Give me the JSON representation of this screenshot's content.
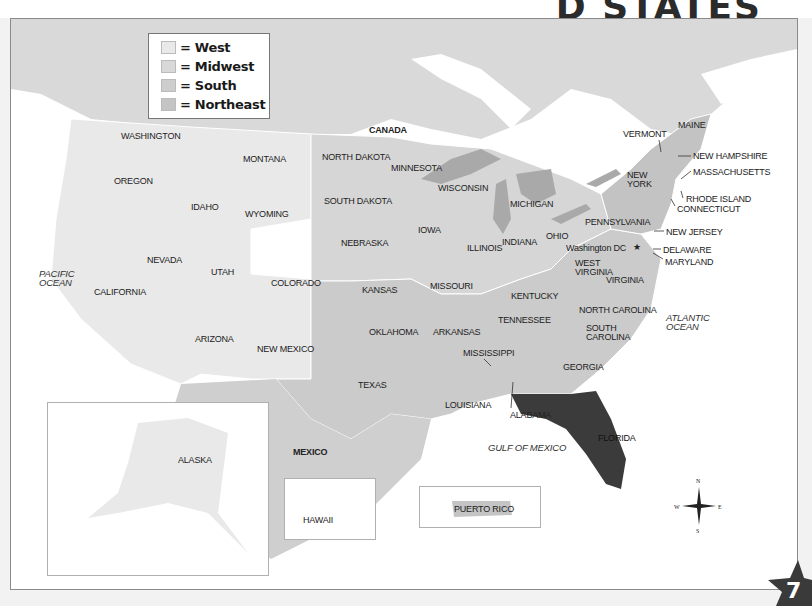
{
  "title": {
    "visible_fragment": "D STATES"
  },
  "legend": {
    "items": [
      {
        "label": "= West",
        "color": "#e9e9e9"
      },
      {
        "label": "= Midwest",
        "color": "#d8d8d8"
      },
      {
        "label": "= South",
        "color": "#cdcdcd"
      },
      {
        "label": "= Northeast",
        "color": "#c4c4c4"
      }
    ]
  },
  "countries": {
    "canada": "CANADA",
    "mexico": "MEXICO"
  },
  "oceans": {
    "pacific_1": "PACIFIC",
    "pacific_2": "OCEAN",
    "atlantic_1": "ATLANTIC",
    "atlantic_2": "OCEAN",
    "gulf": "GULF OF MEXICO"
  },
  "states": {
    "washington": "WASHINGTON",
    "oregon": "OREGON",
    "california": "CALIFORNIA",
    "idaho": "IDAHO",
    "nevada": "NEVADA",
    "montana": "MONTANA",
    "wyoming": "WYOMING",
    "utah": "UTAH",
    "colorado": "COLORADO",
    "arizona": "ARIZONA",
    "new_mexico": "NEW MEXICO",
    "north_dakota": "NORTH DAKOTA",
    "south_dakota": "SOUTH DAKOTA",
    "nebraska": "NEBRASKA",
    "kansas": "KANSAS",
    "minnesota": "MINNESOTA",
    "iowa": "IOWA",
    "missouri": "MISSOURI",
    "wisconsin": "WISCONSIN",
    "illinois": "ILLINOIS",
    "michigan": "MICHIGAN",
    "indiana": "INDIANA",
    "ohio": "OHIO",
    "oklahoma": "OKLAHOMA",
    "texas": "TEXAS",
    "arkansas": "ARKANSAS",
    "louisiana": "LOUISIANA",
    "mississippi": "MISSISSIPPI",
    "alabama": "ALABAMA",
    "tennessee": "TENNESSEE",
    "kentucky": "KENTUCKY",
    "georgia": "GEORGIA",
    "florida": "FLORIDA",
    "south_carolina_1": "SOUTH",
    "south_carolina_2": "CAROLINA",
    "north_carolina": "NORTH CAROLINA",
    "virginia": "VIRGINIA",
    "west_virginia_1": "WEST",
    "west_virginia_2": "VIRGINIA",
    "pennsylvania": "PENNSYLVANIA",
    "new_york_1": "NEW",
    "new_york_2": "YORK",
    "vermont": "VERMONT",
    "maine": "MAINE",
    "new_hampshire": "NEW HAMPSHIRE",
    "massachusetts": "MASSACHUSETTS",
    "rhode_island": "RHODE ISLAND",
    "connecticut": "CONNECTICUT",
    "new_jersey": "NEW JERSEY",
    "delaware": "DELAWARE",
    "maryland": "MARYLAND",
    "alaska": "ALASKA",
    "hawaii": "HAWAII",
    "puerto_rico": "PUERTO RICO"
  },
  "capital": {
    "label": "Washington DC",
    "icon": "star-icon"
  },
  "compass": {
    "n": "N",
    "s": "S",
    "e": "E",
    "w": "W"
  },
  "page_number": "7",
  "colors": {
    "west": "#e9e9e9",
    "midwest": "#d6d6d6",
    "south": "#cbcbcb",
    "northeast": "#c3c3c3",
    "canada": "#d9d9d9",
    "mexico": "#cfcfcf",
    "lakes": "#a9a9a9",
    "florida_highlight": "#3b3b3b",
    "water": "#ffffff"
  }
}
